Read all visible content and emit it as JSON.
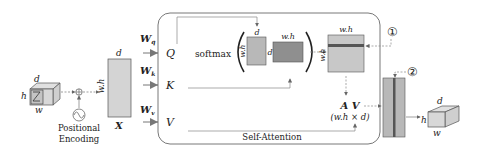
{
  "diagram": {
    "input_tensor": {
      "labels": {
        "h": "h",
        "w": "w",
        "d": "d"
      }
    },
    "positional_encoding": {
      "label_line1": "Positional",
      "label_line2": "Encoding"
    },
    "x_matrix": {
      "label": "X",
      "rows_label": "w.h",
      "cols_label": "d"
    },
    "weights": [
      {
        "symbol": "W",
        "sub": "q",
        "output": "Q"
      },
      {
        "symbol": "W",
        "sub": "k",
        "output": "K"
      },
      {
        "symbol": "W",
        "sub": "v",
        "output": "V"
      }
    ],
    "softmax": {
      "label": "softmax",
      "q_matrix": {
        "rows_label": "w.h",
        "cols_label": "d"
      },
      "kt_matrix": {
        "rows_label": "d",
        "cols_label": "w.h"
      }
    },
    "attention_map": {
      "rows_label": "w.h",
      "cols_label": "w.h"
    },
    "av": {
      "label": "A V",
      "shape": "(w.h × d)"
    },
    "self_attention_label": "Self-Attention",
    "markers": [
      "①",
      "②"
    ],
    "output_tensor": {
      "labels": {
        "h": "h",
        "w": "w",
        "d": "d"
      }
    },
    "colors": {
      "light_gray": "#d4d4d4",
      "mid_gray": "#b8b8b8",
      "dark_gray": "#8f8f8f",
      "stroke": "#555555",
      "arrow": "#777777",
      "band": "#555555"
    }
  }
}
